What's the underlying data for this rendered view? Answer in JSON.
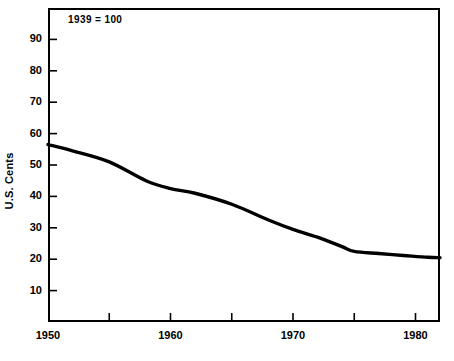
{
  "chart_data": {
    "type": "line",
    "title": "",
    "subtitle": "",
    "annotation": "1939 = 100",
    "xlabel": "",
    "ylabel": "U.S. Cents",
    "xlim": [
      1950,
      1982
    ],
    "ylim": [
      0,
      100
    ],
    "xticks": [
      1950,
      1955,
      1960,
      1965,
      1970,
      1975,
      1980
    ],
    "xtick_labels": [
      "1950",
      "",
      "1960",
      "",
      "1970",
      "",
      "1980"
    ],
    "yticks": [
      10,
      20,
      30,
      40,
      50,
      60,
      70,
      80,
      90
    ],
    "ytick_labels": [
      "10",
      "20",
      "30",
      "40",
      "50",
      "60",
      "70",
      "80",
      "90"
    ],
    "grid": false,
    "legend": null,
    "series": [
      {
        "name": "Purchasing power of the dollar",
        "color": "#000000",
        "x": [
          1950,
          1952,
          1955,
          1958,
          1960,
          1962,
          1965,
          1968,
          1970,
          1972,
          1974,
          1975,
          1977,
          1979,
          1981,
          1982
        ],
        "values": [
          56.5,
          54.5,
          51.0,
          45.0,
          42.5,
          41.0,
          37.5,
          32.5,
          29.5,
          27.0,
          24.0,
          22.5,
          21.8,
          21.2,
          20.6,
          20.5
        ]
      }
    ]
  },
  "axes": {
    "ylabel": "U.S. Cents",
    "annotation": "1939 = 100"
  }
}
